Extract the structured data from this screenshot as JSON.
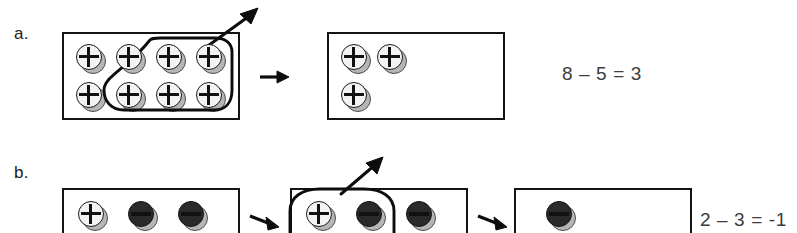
{
  "figure": {
    "cut_off_header_text": "",
    "background_color": "#ffffff",
    "ink_color": "#0d0d0d"
  },
  "rows": [
    {
      "label": "a.",
      "equation": "8 – 5 = 3",
      "panels": [
        {
          "name": "start-mat",
          "chips": [
            {
              "sign": "+",
              "col": 1,
              "row": 1
            },
            {
              "sign": "+",
              "col": 2,
              "row": 1
            },
            {
              "sign": "+",
              "col": 3,
              "row": 1
            },
            {
              "sign": "+",
              "col": 4,
              "row": 1
            },
            {
              "sign": "+",
              "col": 1,
              "row": 2
            },
            {
              "sign": "+",
              "col": 2,
              "row": 2
            },
            {
              "sign": "+",
              "col": 3,
              "row": 2
            },
            {
              "sign": "+",
              "col": 4,
              "row": 2
            }
          ],
          "selected_count": 5
        },
        {
          "name": "result-mat",
          "chips": [
            {
              "sign": "+",
              "col": 1,
              "row": 1
            },
            {
              "sign": "+",
              "col": 2,
              "row": 1
            },
            {
              "sign": "+",
              "col": 1,
              "row": 2
            }
          ],
          "selected_count": 0
        }
      ]
    },
    {
      "label": "b.",
      "equation": "2 – 3 = -1",
      "panels": [
        {
          "name": "start-mat",
          "chips": [
            {
              "sign": "+",
              "col": 1,
              "row": 1
            },
            {
              "sign": "−",
              "col": 2,
              "row": 1
            },
            {
              "sign": "−",
              "col": 3,
              "row": 1
            }
          ],
          "selected_count": 0
        },
        {
          "name": "middle-mat",
          "chips": [
            {
              "sign": "+",
              "col": 1,
              "row": 1
            },
            {
              "sign": "−",
              "col": 2,
              "row": 1
            },
            {
              "sign": "−",
              "col": 3,
              "row": 1
            }
          ],
          "selected_count": 2
        },
        {
          "name": "result-mat",
          "chips": [
            {
              "sign": "−",
              "col": 1,
              "row": 1
            }
          ],
          "selected_count": 0
        }
      ]
    }
  ],
  "glyphs": {
    "plus": "+",
    "minus": "−",
    "transition_arrow": "→",
    "removal_arrow": "↗"
  }
}
